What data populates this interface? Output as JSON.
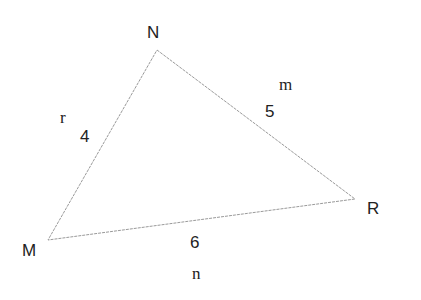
{
  "diagram": {
    "type": "triangle",
    "vertices": [
      {
        "id": "N",
        "label": "N",
        "x": 157,
        "y": 50,
        "lx": 155,
        "ly": 38
      },
      {
        "id": "M",
        "label": "M",
        "x": 48,
        "y": 240,
        "lx": 32,
        "ly": 256
      },
      {
        "id": "R",
        "label": "R",
        "x": 355,
        "y": 199,
        "lx": 373,
        "ly": 214
      }
    ],
    "sides": [
      {
        "name": "r",
        "between": "M-N",
        "length": "4",
        "name_pos": [
          64,
          123
        ],
        "length_pos": [
          86,
          142
        ]
      },
      {
        "name": "m",
        "between": "N-R",
        "length": "5",
        "name_pos": [
          288,
          90
        ],
        "length_pos": [
          272,
          117
        ]
      },
      {
        "name": "n",
        "between": "M-R",
        "length": "6",
        "name_pos": [
          198,
          279
        ],
        "length_pos": [
          197,
          248
        ]
      }
    ],
    "line_color": "#9a9a9a"
  },
  "labels": {
    "N": "N",
    "M": "M",
    "R": "R",
    "r": "r",
    "m": "m",
    "n": "n",
    "side_r": "4",
    "side_m": "5",
    "side_n": "6"
  }
}
